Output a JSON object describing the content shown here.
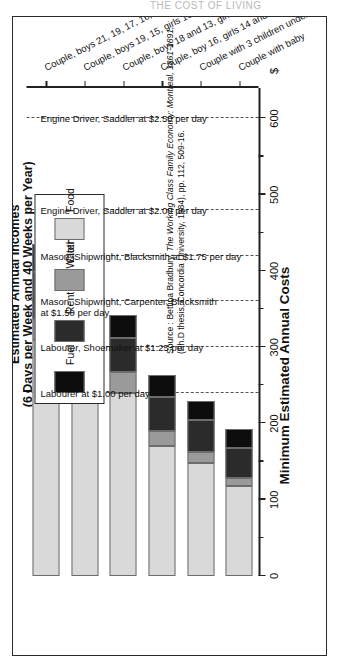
{
  "scan_artifact": "THE COST OF LIVING",
  "chart_data": {
    "type": "bar",
    "orientation": "horizontal-stacked",
    "title": "Minimum Estimated Annual Costs",
    "xlabel": "$",
    "ylabel": "",
    "xlim": [
      0,
      640
    ],
    "grid": "dashed vertical income reference lines",
    "legend_position": "upper-right",
    "currency": "$",
    "categories": [
      "Couple with baby",
      "Couple with 3 children under 5",
      "Couple, boy 16, girls 14 and 8",
      "Couple, boys 18 and 13, girl 17",
      "Couple, boys 19, 15, girls 16, 11, 9",
      "Couple, boys 21, 19, 17, 16, girl 16"
    ],
    "series": [
      {
        "name": "Food",
        "color": "#d9d9d9",
        "values": [
          118,
          148,
          170,
          240,
          255,
          310
        ]
      },
      {
        "name": "Clothing",
        "color": "#9a9a9a",
        "values": [
          10,
          14,
          20,
          27,
          40,
          27
        ]
      },
      {
        "name": "Rent and Water Tax",
        "color": "#2b2b2b",
        "values": [
          40,
          43,
          45,
          45,
          50,
          62
        ]
      },
      {
        "name": "Fuel",
        "color": "#0d0d0d",
        "values": [
          25,
          25,
          28,
          30,
          32,
          36
        ]
      }
    ],
    "totals": [
      193,
      230,
      263,
      342,
      377,
      435
    ],
    "xticks": [
      0,
      100,
      200,
      300,
      400,
      500,
      600
    ],
    "xticklabels": [
      "0",
      "100",
      "200",
      "300",
      "400",
      "500",
      "600"
    ],
    "xminorticks": [
      50,
      150,
      250,
      350,
      450,
      550
    ],
    "income_lines": {
      "heading_line1": "Estimated Annual Incomes",
      "heading_line2": "(6 Days per Week and 40 Weeks per Year)",
      "lines": [
        {
          "value": 600,
          "label": "Engine Driver, Saddler at $2.50 per day"
        },
        {
          "value": 480,
          "label": "Engine Driver, Saddler at $2.00 per day"
        },
        {
          "value": 420,
          "label": "Mason, Shipwright, Blacksmith at $1.75 per day"
        },
        {
          "value": 360,
          "label": "Mason, Shipwright, Carpenter, Blacksmith at $1.50 per day"
        },
        {
          "value": 300,
          "label": "Labourer, Shoemaker at $1.25 per day"
        },
        {
          "value": 240,
          "label": "Labourer at $1.00 per day"
        }
      ]
    },
    "legend": [
      {
        "label": "Fuel",
        "color": "#0d0d0d"
      },
      {
        "label": "Rent and Water Tax",
        "color": "#2b2b2b"
      },
      {
        "label": "Clothing",
        "color": "#9a9a9a"
      },
      {
        "label": "Food",
        "color": "#d9d9d9"
      }
    ],
    "source": {
      "prefix": "Source : Bettina Bradbury, ",
      "title_italic": "The Working Class Family Economy: Montreal, 1861-1891",
      "suffix": ", (Ph.D thesis, Concordia University, 1984), pp. 112, 509-16."
    }
  }
}
